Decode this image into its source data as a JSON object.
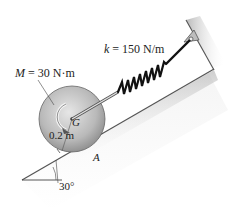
{
  "figure": {
    "type": "engineering-mechanics-diagram",
    "labels": {
      "moment_symbol": "M",
      "moment_value": " = 30 N·m",
      "stiffness_symbol": "k",
      "stiffness_value": " = 150 N/m",
      "center_label": "G",
      "radius": "0.2 m",
      "contact_point": "A",
      "incline_angle": "30°"
    },
    "parameters": {
      "moment": {
        "value": 30,
        "unit": "N·m"
      },
      "spring_stiffness": {
        "value": 150,
        "unit": "N/m"
      },
      "disk_radius": {
        "value": 0.2,
        "unit": "m"
      },
      "incline_angle_deg": 30
    },
    "colors": {
      "disk_light": "#d8d8d8",
      "disk_dark": "#8a8a8a",
      "spring": "#1a1a1a",
      "incline_edge": "#555555",
      "incline_shadow": "#cfcfcf",
      "text": "#222222"
    }
  }
}
